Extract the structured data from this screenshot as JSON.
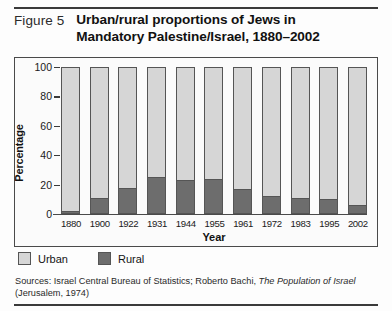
{
  "figure": {
    "number_label": "Figure 5",
    "title_line1": "Urban/rural proportions of Jews in",
    "title_line2": "Mandatory Palestine/Israel, 1880–2002"
  },
  "legend": {
    "urban_label": "Urban",
    "rural_label": "Rural",
    "urban_color": "#d6d6d6",
    "rural_color": "#6d6d6d"
  },
  "source": {
    "prefix": "Sources: Israel Central Bureau of Statistics; Roberto Bachi, ",
    "italic_title": "The Population of Israel",
    "suffix": " (Jerusalem, 1974)"
  },
  "chart_data": {
    "type": "bar",
    "title": "Urban/rural proportions of Jews in Mandatory Palestine/Israel, 1880–2002",
    "xlabel": "Year",
    "ylabel": "Percentage",
    "ylim": [
      0,
      100
    ],
    "yticks": [
      100,
      80,
      60,
      40,
      20,
      0
    ],
    "grid": false,
    "stacked": true,
    "legend_position": "below-left",
    "categories": [
      "1880",
      "1900",
      "1922",
      "1931",
      "1944",
      "1955",
      "1961",
      "1972",
      "1983",
      "1995",
      "2002"
    ],
    "series": [
      {
        "name": "Urban",
        "color": "#d6d6d6",
        "values": [
          98,
          89,
          82,
          75,
          77,
          76,
          83,
          88,
          89,
          90,
          94
        ]
      },
      {
        "name": "Rural",
        "color": "#6d6d6d",
        "values": [
          2,
          11,
          18,
          25,
          23,
          24,
          17,
          12,
          11,
          10,
          6
        ]
      }
    ]
  }
}
